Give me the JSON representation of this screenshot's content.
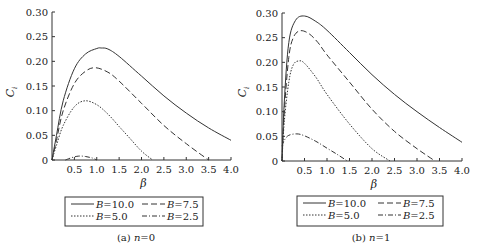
{
  "chart_data": [
    {
      "type": "line",
      "caption": "(a) n=0",
      "caption_prefix": "(a) ",
      "caption_var": "n",
      "caption_val": "=0",
      "xlabel": "β",
      "ylabel": "C_i",
      "xlim": [
        0,
        4.0
      ],
      "ylim": [
        0,
        0.3
      ],
      "xticks": [
        "0.5",
        "1.0",
        "1.5",
        "2.0",
        "2.5",
        "3.0",
        "3.5",
        "4.0"
      ],
      "yticks": [
        "0",
        "0.05",
        "0.10",
        "0.15",
        "0.20",
        "0.25",
        "0.30"
      ],
      "grid": false,
      "legend_position": "below",
      "series": [
        {
          "name": "B=10.0",
          "style": "solid",
          "x": [
            0.0,
            0.1,
            0.25,
            0.5,
            0.75,
            1.0,
            1.1,
            1.25,
            1.5,
            2.0,
            2.5,
            3.0,
            3.5,
            4.0
          ],
          "y": [
            0.0,
            0.05,
            0.12,
            0.185,
            0.215,
            0.226,
            0.227,
            0.225,
            0.21,
            0.17,
            0.13,
            0.095,
            0.065,
            0.04
          ]
        },
        {
          "name": "B=7.5",
          "style": "dashed",
          "x": [
            0.0,
            0.1,
            0.25,
            0.5,
            0.75,
            0.97,
            1.25,
            1.5,
            2.0,
            2.5,
            3.0,
            3.5
          ],
          "y": [
            0.0,
            0.04,
            0.1,
            0.155,
            0.18,
            0.187,
            0.178,
            0.16,
            0.115,
            0.07,
            0.033,
            0.0
          ]
        },
        {
          "name": "B=5.0",
          "style": "dotted",
          "x": [
            0.0,
            0.1,
            0.25,
            0.5,
            0.74,
            1.0,
            1.25,
            1.5,
            1.75,
            2.0,
            2.25
          ],
          "y": [
            0.0,
            0.03,
            0.07,
            0.108,
            0.12,
            0.112,
            0.093,
            0.068,
            0.043,
            0.018,
            0.0
          ]
        },
        {
          "name": "B=2.5",
          "style": "dash-dot",
          "x": [
            0.3,
            0.45,
            0.6,
            0.75,
            0.9,
            1.0
          ],
          "y": [
            0.0,
            0.005,
            0.008,
            0.007,
            0.004,
            0.0
          ]
        }
      ]
    },
    {
      "type": "line",
      "caption": "(b) n=1",
      "caption_prefix": "(b) ",
      "caption_var": "n",
      "caption_val": "=1",
      "xlabel": "β",
      "ylabel": "C_i",
      "xlim": [
        0,
        4.0
      ],
      "ylim": [
        0,
        0.3
      ],
      "xticks": [
        "0.5",
        "1.0",
        "1.5",
        "2.0",
        "2.5",
        "3.0",
        "3.5",
        "4.0"
      ],
      "yticks": [
        "0",
        "0.05",
        "0.10",
        "0.15",
        "0.20",
        "0.25",
        "0.30"
      ],
      "grid": false,
      "legend_position": "below",
      "series": [
        {
          "name": "B=10.0",
          "style": "solid",
          "x": [
            0.0,
            0.05,
            0.15,
            0.3,
            0.5,
            0.75,
            1.0,
            1.5,
            2.0,
            2.5,
            3.0,
            3.5,
            4.0
          ],
          "y": [
            0.0,
            0.12,
            0.24,
            0.285,
            0.294,
            0.283,
            0.265,
            0.22,
            0.175,
            0.135,
            0.1,
            0.068,
            0.038
          ]
        },
        {
          "name": "B=7.5",
          "style": "dashed",
          "x": [
            0.0,
            0.05,
            0.15,
            0.25,
            0.4,
            0.6,
            0.8,
            1.0,
            1.5,
            2.0,
            2.5,
            3.0,
            3.4
          ],
          "y": [
            0.0,
            0.1,
            0.21,
            0.25,
            0.264,
            0.258,
            0.24,
            0.215,
            0.16,
            0.105,
            0.06,
            0.025,
            0.0
          ]
        },
        {
          "name": "B=5.0",
          "style": "dotted",
          "x": [
            0.0,
            0.05,
            0.15,
            0.25,
            0.38,
            0.5,
            0.75,
            1.0,
            1.5,
            2.0,
            2.4
          ],
          "y": [
            0.0,
            0.08,
            0.16,
            0.195,
            0.203,
            0.198,
            0.17,
            0.135,
            0.075,
            0.025,
            0.0
          ]
        },
        {
          "name": "B=2.5",
          "style": "dash-dot",
          "x": [
            0.0,
            0.05,
            0.15,
            0.33,
            0.5,
            0.75,
            1.0,
            1.25,
            1.45
          ],
          "y": [
            0.03,
            0.042,
            0.052,
            0.055,
            0.051,
            0.04,
            0.026,
            0.012,
            0.0
          ]
        }
      ]
    }
  ]
}
